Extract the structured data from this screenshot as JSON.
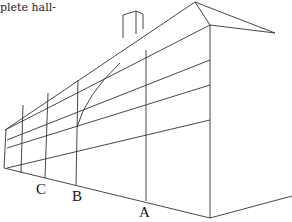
{
  "caption": "plete hall-",
  "figure": {
    "labels": {
      "a": "A",
      "b": "B",
      "c": "C"
    }
  }
}
